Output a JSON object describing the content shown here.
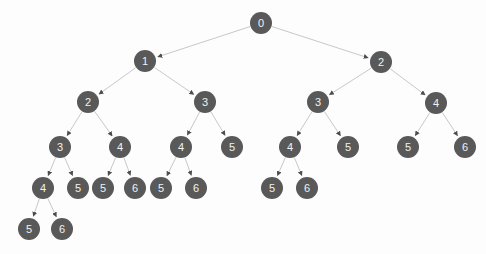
{
  "diagram": {
    "type": "tree",
    "background_color": "#fdfdfd",
    "node_fill_color": "#595959",
    "node_text_color": "#f2f2f2",
    "edge_color": "#c8c8c8",
    "arrowhead_color": "#4d4d4d",
    "node_radius": 11,
    "width": 486,
    "height": 254,
    "nodes": [
      {
        "id": "n0",
        "label": "0",
        "x": 261,
        "y": 23,
        "r": 11,
        "depth": 0
      },
      {
        "id": "n1",
        "label": "1",
        "x": 145,
        "y": 61,
        "r": 11,
        "depth": 1
      },
      {
        "id": "n2",
        "label": "2",
        "x": 381,
        "y": 62,
        "r": 11,
        "depth": 1
      },
      {
        "id": "n3",
        "label": "2",
        "x": 88,
        "y": 102,
        "r": 11,
        "depth": 2
      },
      {
        "id": "n4",
        "label": "3",
        "x": 205,
        "y": 102,
        "r": 11,
        "depth": 2
      },
      {
        "id": "n5",
        "label": "3",
        "x": 318,
        "y": 102,
        "r": 11,
        "depth": 2
      },
      {
        "id": "n6",
        "label": "4",
        "x": 436,
        "y": 103,
        "r": 11,
        "depth": 2
      },
      {
        "id": "n7",
        "label": "3",
        "x": 60,
        "y": 147,
        "r": 11,
        "depth": 3
      },
      {
        "id": "n8",
        "label": "4",
        "x": 120,
        "y": 147,
        "r": 11,
        "depth": 3
      },
      {
        "id": "n9",
        "label": "4",
        "x": 181,
        "y": 147,
        "r": 11,
        "depth": 3
      },
      {
        "id": "n10",
        "label": "5",
        "x": 232,
        "y": 147,
        "r": 11,
        "depth": 3
      },
      {
        "id": "n11",
        "label": "4",
        "x": 290,
        "y": 147,
        "r": 11,
        "depth": 3
      },
      {
        "id": "n12",
        "label": "5",
        "x": 348,
        "y": 147,
        "r": 11,
        "depth": 3
      },
      {
        "id": "n13",
        "label": "5",
        "x": 408,
        "y": 147,
        "r": 11,
        "depth": 3
      },
      {
        "id": "n14",
        "label": "6",
        "x": 465,
        "y": 147,
        "r": 11,
        "depth": 3
      },
      {
        "id": "n15",
        "label": "4",
        "x": 43,
        "y": 188,
        "r": 11,
        "depth": 4
      },
      {
        "id": "n16",
        "label": "5",
        "x": 78,
        "y": 188,
        "r": 11,
        "depth": 4
      },
      {
        "id": "n17",
        "label": "5",
        "x": 103,
        "y": 188,
        "r": 11,
        "depth": 4
      },
      {
        "id": "n18",
        "label": "6",
        "x": 135,
        "y": 188,
        "r": 11,
        "depth": 4
      },
      {
        "id": "n19",
        "label": "5",
        "x": 161,
        "y": 188,
        "r": 11,
        "depth": 4
      },
      {
        "id": "n20",
        "label": "6",
        "x": 196,
        "y": 188,
        "r": 11,
        "depth": 4
      },
      {
        "id": "n21",
        "label": "5",
        "x": 272,
        "y": 188,
        "r": 11,
        "depth": 4
      },
      {
        "id": "n22",
        "label": "6",
        "x": 307,
        "y": 188,
        "r": 11,
        "depth": 4
      },
      {
        "id": "n23",
        "label": "5",
        "x": 29,
        "y": 229,
        "r": 11,
        "depth": 5
      },
      {
        "id": "n24",
        "label": "6",
        "x": 62,
        "y": 229,
        "r": 11,
        "depth": 5
      }
    ],
    "edges": [
      {
        "from": "n0",
        "to": "n1"
      },
      {
        "from": "n0",
        "to": "n2"
      },
      {
        "from": "n1",
        "to": "n3"
      },
      {
        "from": "n1",
        "to": "n4"
      },
      {
        "from": "n2",
        "to": "n5"
      },
      {
        "from": "n2",
        "to": "n6"
      },
      {
        "from": "n3",
        "to": "n7"
      },
      {
        "from": "n3",
        "to": "n8"
      },
      {
        "from": "n4",
        "to": "n9"
      },
      {
        "from": "n4",
        "to": "n10"
      },
      {
        "from": "n5",
        "to": "n11"
      },
      {
        "from": "n5",
        "to": "n12"
      },
      {
        "from": "n6",
        "to": "n13"
      },
      {
        "from": "n6",
        "to": "n14"
      },
      {
        "from": "n7",
        "to": "n15"
      },
      {
        "from": "n7",
        "to": "n16"
      },
      {
        "from": "n8",
        "to": "n17"
      },
      {
        "from": "n8",
        "to": "n18"
      },
      {
        "from": "n9",
        "to": "n19"
      },
      {
        "from": "n9",
        "to": "n20"
      },
      {
        "from": "n11",
        "to": "n21"
      },
      {
        "from": "n11",
        "to": "n22"
      },
      {
        "from": "n15",
        "to": "n23"
      },
      {
        "from": "n15",
        "to": "n24"
      }
    ]
  }
}
